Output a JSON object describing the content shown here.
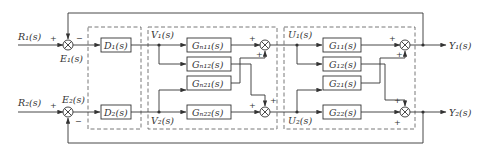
{
  "diagram": {
    "type": "MIMO control block diagram with decoupling",
    "inputs": {
      "r1": "R₁(s)",
      "r2": "R₂(s)"
    },
    "errors": {
      "e1": "E₁(s)",
      "e2": "E₂(s)"
    },
    "controllers": {
      "d1": "D₁(s)",
      "d2": "D₂(s)"
    },
    "controller_outputs": {
      "v1": "V₁(s)",
      "v2": "V₂(s)"
    },
    "decoupler": {
      "g11": "G_n11(s)",
      "g12": "G_n12(s)",
      "g21": "G_n21(s)",
      "g22": "G_n22(s)"
    },
    "decoupler_labels": {
      "g11": "Gₙ₁₁(s)",
      "g12": "Gₙ₁₂(s)",
      "g21": "Gₙ₂₁(s)",
      "g22": "Gₙ₂₂(s)"
    },
    "decoupler_outputs": {
      "u1": "U₁(s)",
      "u2": "U₂(s)"
    },
    "plant_labels": {
      "g11": "G₁₁(s)",
      "g12": "G₁₂(s)",
      "g21": "G₂₁(s)",
      "g22": "G₂₂(s)"
    },
    "outputs": {
      "y1": "Y₁(s)",
      "y2": "Y₂(s)"
    },
    "signs": {
      "plus": "+",
      "minus": "−"
    }
  }
}
